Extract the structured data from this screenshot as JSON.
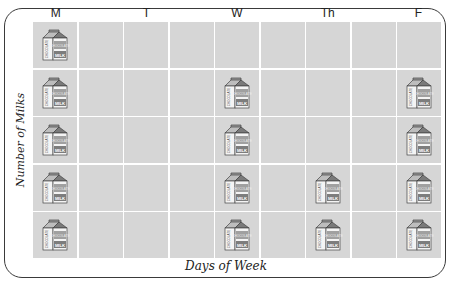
{
  "chart_data": {
    "type": "bar",
    "subtype": "pictograph",
    "title": "",
    "categories": [
      "M",
      "T",
      "W",
      "Th",
      "F"
    ],
    "values": [
      5,
      0,
      4,
      2,
      4
    ],
    "xlabel": "Days of Week",
    "ylabel": "Number of Milks",
    "ylim": [
      0,
      5
    ],
    "grid": true,
    "icon": "chocolate-milk-carton",
    "icon_text": {
      "top": "CHOCOLATE",
      "bottom": "MILK"
    },
    "legend": null
  },
  "labels": {
    "days": [
      "M",
      "T",
      "W",
      "Th",
      "F"
    ],
    "xlabel": "Days of Week",
    "ylabel": "Number of Milks",
    "carton_top": "CHOCOLATE",
    "carton_bottom": "MILK"
  },
  "colors": {
    "cell": "#d6d6d6",
    "gridline": "#ffffff",
    "border": "#3a3a3a",
    "carton_band": "#8a8a8a"
  }
}
